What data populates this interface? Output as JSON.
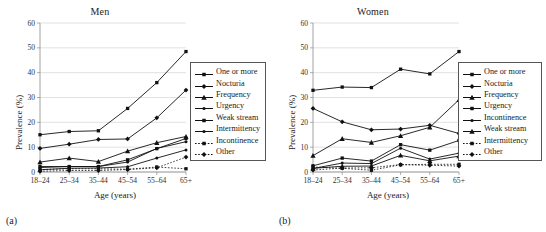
{
  "figure": {
    "panels": [
      {
        "panel_label": "(a)",
        "title": "Men",
        "xlabel": "Age (years)",
        "ylabel": "Prevalence (%)"
      },
      {
        "panel_label": "(b)",
        "title": "Women",
        "xlabel": "Age (years)",
        "ylabel": "Prevalence (%)"
      }
    ]
  },
  "chart_data": [
    {
      "type": "line",
      "title": "Men",
      "panel": "(a)",
      "xlabel": "Age (years)",
      "ylabel": "Prevalence (%)",
      "categories": [
        "18–24",
        "25–34",
        "35–44",
        "45–54",
        "55–64",
        "65+"
      ],
      "ylim": [
        0,
        60
      ],
      "yticks": [
        0,
        10,
        20,
        30,
        40,
        50,
        60
      ],
      "grid": true,
      "legend_position": "right-outside",
      "series": [
        {
          "name": "One or more",
          "marker": "square",
          "line": "solid",
          "values": [
            15.0,
            16.3,
            16.6,
            25.6,
            36.0,
            48.5
          ]
        },
        {
          "name": "Nocturia",
          "marker": "diamond",
          "line": "solid",
          "values": [
            9.5,
            11.2,
            13.1,
            13.3,
            21.8,
            33.0
          ]
        },
        {
          "name": "Frequency",
          "marker": "triangle",
          "line": "solid",
          "values": [
            4.0,
            5.6,
            4.2,
            8.4,
            11.8,
            14.3
          ]
        },
        {
          "name": "Urgency",
          "marker": "dot",
          "line": "solid",
          "values": [
            1.8,
            2.2,
            2.2,
            4.0,
            9.5,
            12.2
          ]
        },
        {
          "name": "Weak stream",
          "marker": "square",
          "line": "solid",
          "values": [
            2.2,
            2.2,
            2.2,
            4.9,
            9.4,
            13.5
          ]
        },
        {
          "name": "Intermittency",
          "marker": "dot",
          "line": "solid",
          "values": [
            0.9,
            1.5,
            1.6,
            2.1,
            5.6,
            8.9
          ]
        },
        {
          "name": "Incontinence",
          "marker": "square",
          "line": "dotted",
          "values": [
            1.0,
            1.3,
            1.3,
            1.1,
            2.0,
            1.3
          ]
        },
        {
          "name": "Other",
          "marker": "diamond",
          "line": "dotted",
          "values": [
            0.3,
            0.6,
            0.6,
            1.0,
            1.7,
            6.0
          ]
        }
      ]
    },
    {
      "type": "line",
      "title": "Women",
      "panel": "(b)",
      "xlabel": "Age (years)",
      "ylabel": "Prevalence (%)",
      "categories": [
        "18–24",
        "25–34",
        "35–44",
        "45–54",
        "55–64",
        "65+"
      ],
      "ylim": [
        0,
        60
      ],
      "yticks": [
        0,
        10,
        20,
        30,
        40,
        50,
        60
      ],
      "grid": true,
      "legend_position": "right-outside",
      "series": [
        {
          "name": "One or more",
          "marker": "square",
          "line": "solid",
          "values": [
            32.9,
            34.2,
            34.0,
            41.4,
            39.5,
            48.5
          ]
        },
        {
          "name": "Nocturia",
          "marker": "diamond",
          "line": "solid",
          "values": [
            25.6,
            20.2,
            17.0,
            17.3,
            18.8,
            15.5
          ]
        },
        {
          "name": "Frequency",
          "marker": "triangle",
          "line": "solid",
          "values": [
            6.6,
            13.4,
            11.9,
            14.6,
            18.0,
            29.1
          ]
        },
        {
          "name": "Urgency",
          "marker": "square",
          "line": "solid",
          "values": [
            2.5,
            5.6,
            4.4,
            11.0,
            8.8,
            12.7
          ]
        },
        {
          "name": "Incontinence",
          "marker": "dot",
          "line": "solid",
          "values": [
            1.4,
            3.6,
            3.4,
            9.6,
            5.2,
            7.6
          ]
        },
        {
          "name": "Weak stream",
          "marker": "triangle",
          "line": "solid",
          "values": [
            1.5,
            2.3,
            2.4,
            6.7,
            4.5,
            6.4
          ]
        },
        {
          "name": "Intermittency",
          "marker": "square",
          "line": "dotted",
          "values": [
            2.0,
            1.5,
            0.7,
            2.9,
            3.1,
            3.1
          ]
        },
        {
          "name": "Other",
          "marker": "diamond",
          "line": "dotted",
          "values": [
            0.8,
            1.6,
            1.7,
            3.0,
            2.7,
            2.4
          ]
        }
      ]
    }
  ]
}
